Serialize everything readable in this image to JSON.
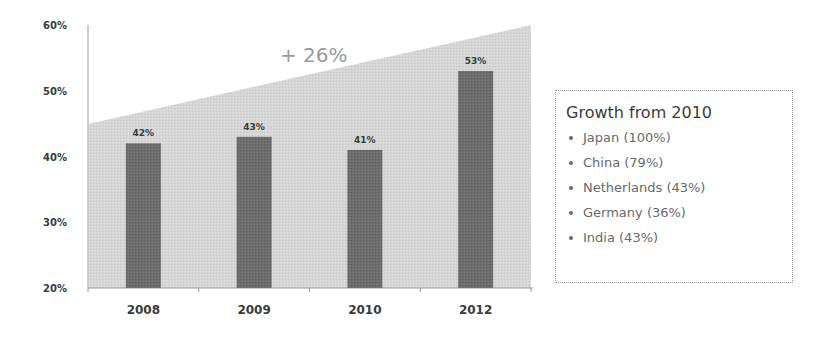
{
  "chart_data": {
    "type": "bar",
    "title": "",
    "xlabel": "",
    "ylabel": "",
    "categories": [
      "2008",
      "2009",
      "2010",
      "2012"
    ],
    "values": [
      42,
      43,
      41,
      53
    ],
    "value_labels": [
      "42%",
      "43%",
      "41%",
      "53%"
    ],
    "ylim": [
      20,
      60
    ],
    "yticks": [
      20,
      30,
      40,
      50,
      60
    ],
    "ytick_labels": [
      "20%",
      "30%",
      "40%",
      "50%",
      "60%"
    ],
    "grid": false,
    "background_trend_area": {
      "start_value": 45,
      "end_value": 60,
      "annotation": "+ 26%"
    },
    "legend_position": "right",
    "colors": {
      "bar": "#6b6b6b",
      "trend_area": "#d8d8d8",
      "axis": "#9a9a9a"
    }
  },
  "legend": {
    "title": "Growth from 2010",
    "items": [
      {
        "label": "Japan (100%)"
      },
      {
        "label": "China (79%)"
      },
      {
        "label": "Netherlands (43%)"
      },
      {
        "label": "Germany (36%)"
      },
      {
        "label": "India (43%)"
      }
    ]
  }
}
